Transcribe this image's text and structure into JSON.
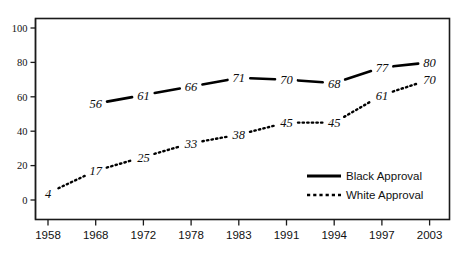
{
  "chart_data": {
    "type": "line",
    "title": "",
    "subtitle": "",
    "xlabel": "",
    "ylabel": "",
    "categories": [
      "1958",
      "1968",
      "1972",
      "1978",
      "1983",
      "1991",
      "1994",
      "1997",
      "2003"
    ],
    "series": [
      {
        "name": "Black Approval",
        "style": "solid",
        "values": [
          null,
          56,
          61,
          66,
          71,
          70,
          68,
          77,
          80
        ],
        "labels": [
          "",
          "56",
          "61",
          "66",
          "71",
          "70",
          "68",
          "77",
          "80"
        ]
      },
      {
        "name": "White Approval",
        "style": "dotted",
        "values": [
          4,
          17,
          25,
          33,
          38,
          45,
          45,
          61,
          70
        ],
        "labels": [
          "4",
          "17",
          "25",
          "33",
          "38",
          "45",
          "45",
          "61",
          "70"
        ]
      }
    ],
    "ylim": [
      0,
      100
    ],
    "yticks": [
      "0",
      "20",
      "40",
      "60",
      "80",
      "100"
    ],
    "ytick_values": [
      0,
      20,
      40,
      60,
      80,
      100
    ],
    "grid": false,
    "legend_position": "inside-bottom-right",
    "legend_entries": [
      {
        "label": "Black Approval",
        "style": "solid"
      },
      {
        "label": "White Approval",
        "style": "dotted"
      }
    ],
    "colors": {
      "line": "#000000",
      "axis": "#1a1a1a",
      "text": "#111111",
      "background": "#ffffff"
    }
  }
}
